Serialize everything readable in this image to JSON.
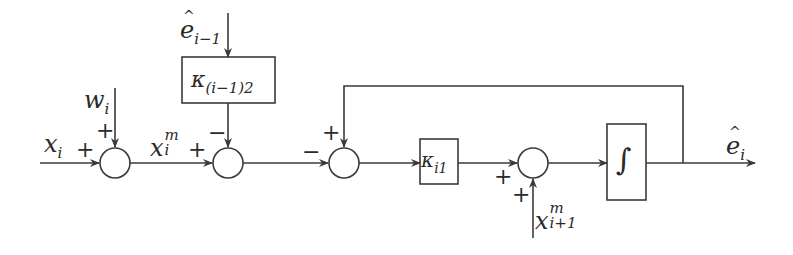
{
  "diagram": {
    "title": "",
    "stroke_color": "#3a3a3a",
    "background": "#ffffff",
    "nodes": [
      {
        "id": "sum1",
        "type": "summing_junction",
        "inputs": [
          {
            "from": "x_i",
            "sign": "+"
          },
          {
            "from": "w_i",
            "sign": "+"
          }
        ]
      },
      {
        "id": "sum2",
        "type": "summing_junction",
        "inputs": [
          {
            "from": "sum1",
            "sign": "+"
          },
          {
            "from": "kappa_prev2",
            "sign": "-"
          }
        ]
      },
      {
        "id": "kappa_prev2",
        "type": "gain_block",
        "label": "κ_(i−1)2",
        "input": "e_hat_prev"
      },
      {
        "id": "sum3",
        "type": "summing_junction",
        "inputs": [
          {
            "from": "sum2",
            "sign": "-"
          },
          {
            "from": "feedback",
            "sign": "+"
          }
        ]
      },
      {
        "id": "kappa_i1",
        "type": "gain_block",
        "label": "κ_i1"
      },
      {
        "id": "sum4",
        "type": "summing_junction",
        "inputs": [
          {
            "from": "kappa_i1",
            "sign": "+"
          },
          {
            "from": "x_next",
            "sign": "+"
          }
        ]
      },
      {
        "id": "integrator",
        "type": "integrator_block",
        "label": "∫"
      }
    ],
    "signals": {
      "x_i": {
        "base": "x",
        "sub": "i"
      },
      "w_i": {
        "base": "w",
        "sub": "i"
      },
      "x_m_i": {
        "base": "x",
        "sup": "m",
        "sub": "i"
      },
      "e_hat_prev": {
        "base": "ê",
        "sub": "i−1"
      },
      "x_next": {
        "base": "x",
        "sup": "m",
        "sub": "i+1"
      },
      "e_hat_i": {
        "base": "ê",
        "sub": "i"
      }
    },
    "labels": {
      "x_i_base": "x",
      "x_i_sub": "i",
      "w_i_base": "w",
      "w_i_sub": "i",
      "xm_base": "x",
      "xm_sup": "m",
      "xm_sub": "i",
      "eprev_base": "e",
      "eprev_sub": "i−1",
      "kappa2_base": "κ",
      "kappa2_sub": "(i−1)2",
      "kappa1_base": "κ",
      "kappa1_sub": "i1",
      "xnext_base": "x",
      "xnext_sup": "m",
      "xnext_sub": "i+1",
      "ei_base": "e",
      "ei_sub": "i",
      "integral": "∫"
    },
    "signs": {
      "sum1_left": "+",
      "sum1_top": "+",
      "sum2_left": "+",
      "sum2_top": "−",
      "sum3_left": "−",
      "sum3_top": "+",
      "sum4_left": "+",
      "sum4_bottom": "+"
    }
  }
}
